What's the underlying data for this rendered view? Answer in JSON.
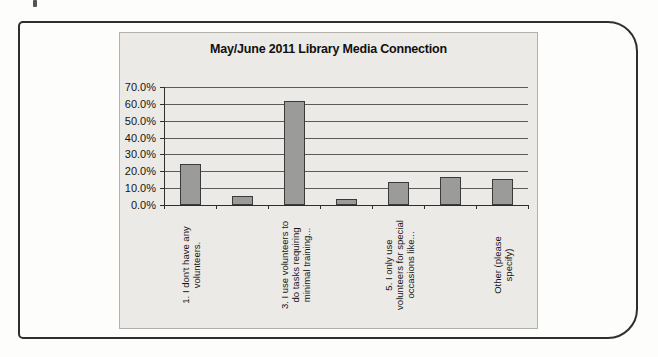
{
  "page": {
    "background": "#fdfdfb",
    "frame_border_color": "#2f2f2f"
  },
  "chart": {
    "title": "May/June 2011 Library Media Connection",
    "background": "#eceae6"
  },
  "chart_data": {
    "type": "bar",
    "title": "May/June 2011 Library Media Connection",
    "categories": [
      "1. I don't have any\nvolunteers.",
      "",
      "3. I use volunteers to\ndo tasks requiring\nminimal training...",
      "",
      "5. I only use\nvolunteers for special\noccasions like...",
      "",
      "Other (please\nspecify)"
    ],
    "values": [
      24.5,
      5.5,
      61.5,
      3.5,
      13.5,
      16.5,
      15.5
    ],
    "xlabel": "",
    "ylabel": "",
    "ylim": [
      0,
      70
    ],
    "ytick_step": 10,
    "ytick_labels": [
      "0.0%",
      "10.0%",
      "20.0%",
      "30.0%",
      "40.0%",
      "50.0%",
      "60.0%",
      "70.0%"
    ],
    "x_label_rotation_deg": 90,
    "grid": true,
    "legend": false,
    "bar_color": "#9b9b99",
    "bar_border_color": "#3a3a3a",
    "gridline_color": "#5a5a5a",
    "plot_background": "#eceae6"
  }
}
